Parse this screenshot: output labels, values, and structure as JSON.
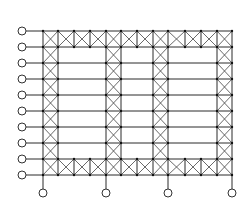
{
  "diagram": {
    "type": "braced-frame-structure",
    "colors": {
      "line": "#2a2a2a",
      "brace": "#444444",
      "background": "#ffffff"
    },
    "grid": {
      "x": [
        43,
        58,
        74,
        90,
        106,
        121,
        137,
        153,
        168,
        185,
        201,
        217,
        232
      ],
      "y": [
        31,
        47,
        63,
        79,
        95,
        111,
        127,
        143,
        159,
        175
      ]
    },
    "braced_row_bands": [
      0,
      8
    ],
    "braced_column_bays": [
      0,
      4,
      7,
      11
    ],
    "left_supports": {
      "x_circle": 22,
      "radius": 4,
      "rows": [
        0,
        1,
        2,
        3,
        4,
        5,
        6,
        7,
        8,
        9
      ]
    },
    "bottom_supports": {
      "y_circle": 193,
      "radius": 4,
      "columns": [
        0,
        4,
        8,
        12
      ]
    }
  }
}
